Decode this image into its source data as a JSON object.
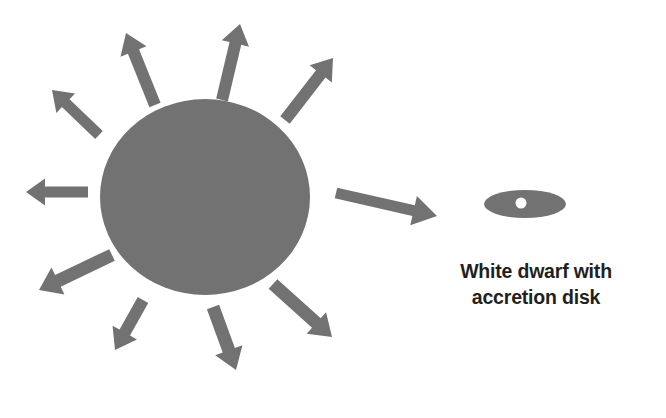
{
  "canvas": {
    "width": 666,
    "height": 418,
    "background": "#ffffff"
  },
  "palette": {
    "shape_fill": "#727272",
    "text_color": "#231f20",
    "hole_fill": "#ffffff"
  },
  "diagram": {
    "title_text": "",
    "kind": "astronomy-schematic"
  },
  "star": {
    "name_label": "donor-star",
    "cx": 205,
    "cy": 197,
    "rx": 105,
    "ry": 98,
    "fill": "#727272"
  },
  "white_dwarf": {
    "name_label": "white-dwarf-accretion-disk",
    "disk": {
      "cx": 525,
      "cy": 204,
      "rx": 41,
      "ry": 14,
      "fill": "#727272"
    },
    "hole": {
      "cx": 521,
      "cy": 203,
      "r": 5.5,
      "fill": "#ffffff"
    }
  },
  "caption": {
    "line1": "White dwarf with",
    "line2": "accretion disk",
    "full_text": "White dwarf with\naccretion disk",
    "color": "#231f20",
    "bold": true,
    "font_size_px": 19.5
  },
  "arrows": [
    {
      "id": "arrow-west",
      "label": "outflow-arrow-west",
      "x1": 88,
      "y1": 192,
      "x2": 26,
      "y2": 192,
      "shaft": 11,
      "head_len": 19,
      "head_w": 27
    },
    {
      "id": "arrow-northwest",
      "label": "outflow-arrow-northwest",
      "x1": 99,
      "y1": 135,
      "x2": 52,
      "y2": 90,
      "shaft": 11,
      "head_len": 19,
      "head_w": 27
    },
    {
      "id": "arrow-north-nw",
      "label": "outflow-arrow-north-northwest",
      "x1": 155,
      "y1": 105,
      "x2": 126,
      "y2": 33,
      "shaft": 12,
      "head_len": 20,
      "head_w": 28
    },
    {
      "id": "arrow-north",
      "label": "outflow-arrow-north",
      "x1": 222,
      "y1": 100,
      "x2": 240,
      "y2": 24,
      "shaft": 12,
      "head_len": 20,
      "head_w": 28
    },
    {
      "id": "arrow-northeast",
      "label": "outflow-arrow-northeast",
      "x1": 285,
      "y1": 120,
      "x2": 333,
      "y2": 58,
      "shaft": 12,
      "head_len": 20,
      "head_w": 28
    },
    {
      "id": "arrow-east",
      "label": "accretion-stream-arrow-east",
      "x1": 336,
      "y1": 193,
      "x2": 437,
      "y2": 216,
      "shaft": 11,
      "head_len": 24,
      "head_w": 30
    },
    {
      "id": "arrow-southeast",
      "label": "outflow-arrow-southeast",
      "x1": 273,
      "y1": 284,
      "x2": 332,
      "y2": 337,
      "shaft": 13,
      "head_len": 21,
      "head_w": 29
    },
    {
      "id": "arrow-south",
      "label": "outflow-arrow-south",
      "x1": 213,
      "y1": 307,
      "x2": 236,
      "y2": 370,
      "shaft": 13,
      "head_len": 21,
      "head_w": 29
    },
    {
      "id": "arrow-south-sw",
      "label": "outflow-arrow-south-southwest",
      "x1": 143,
      "y1": 300,
      "x2": 115,
      "y2": 350,
      "shaft": 12,
      "head_len": 20,
      "head_w": 28
    },
    {
      "id": "arrow-southwest",
      "label": "outflow-arrow-southwest",
      "x1": 112,
      "y1": 255,
      "x2": 39,
      "y2": 290,
      "shaft": 13,
      "head_len": 21,
      "head_w": 30
    }
  ]
}
